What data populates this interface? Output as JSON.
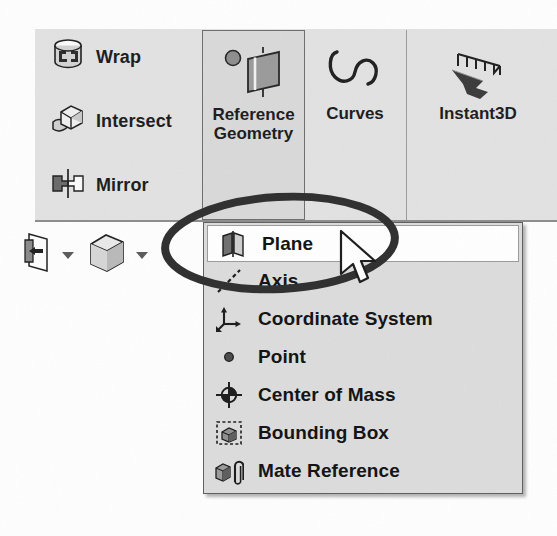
{
  "app": {
    "name": "SolidWorks",
    "surface": "features-ribbon-with-reference-geometry-dropdown"
  },
  "ribbon": {
    "commands": [
      {
        "label": "Wrap",
        "icon": "wrap-icon"
      },
      {
        "label": "Intersect",
        "icon": "intersect-icon"
      },
      {
        "label": "Mirror",
        "icon": "mirror-icon"
      }
    ],
    "buttons": [
      {
        "label": "Reference\nGeometry",
        "icon": "reference-geometry-icon",
        "state": "pressed"
      },
      {
        "label": "Curves",
        "icon": "curves-icon",
        "state": "normal"
      },
      {
        "label": "Instant3D",
        "icon": "instant3d-icon",
        "state": "normal"
      }
    ]
  },
  "lower_toolbar": {
    "items": [
      {
        "icon": "mirror-plane-icon",
        "dropdown": "chevron-down-icon"
      },
      {
        "icon": "cube-icon",
        "dropdown": "chevron-down-icon"
      }
    ]
  },
  "menu": {
    "title": "Reference Geometry",
    "items": [
      {
        "label": "Plane",
        "icon": "plane-icon",
        "selected": true
      },
      {
        "label": "Axis",
        "icon": "axis-icon",
        "selected": false
      },
      {
        "label": "Coordinate System",
        "icon": "coordinate-system-icon",
        "selected": false
      },
      {
        "label": "Point",
        "icon": "point-icon",
        "selected": false
      },
      {
        "label": "Center of Mass",
        "icon": "center-of-mass-icon",
        "selected": false
      },
      {
        "label": "Bounding Box",
        "icon": "bounding-box-icon",
        "selected": false
      },
      {
        "label": "Mate Reference",
        "icon": "mate-reference-icon",
        "selected": false
      }
    ]
  },
  "annotation": {
    "shape": "ellipse-highlight",
    "targets": "Plane",
    "color": "#2b2b2b"
  },
  "cursor": {
    "type": "arrow-pointer"
  },
  "colors": {
    "ribbon_bg": "#e2e2e2",
    "menu_bg": "#dcdcdc",
    "selected_bg": "#ffffff",
    "border": "#5e5e5e",
    "text": "#111111"
  }
}
